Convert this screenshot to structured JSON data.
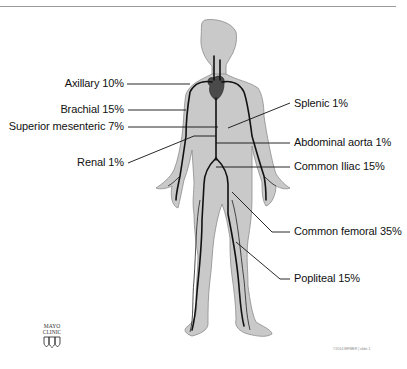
{
  "labels": [
    {
      "id": "axillary",
      "text": "Axillary 10%",
      "side": "left"
    },
    {
      "id": "brachial",
      "text": "Brachial 15%",
      "side": "left"
    },
    {
      "id": "superior-mesenteric",
      "text": "Superior mesenteric 7%",
      "side": "left"
    },
    {
      "id": "renal",
      "text": "Renal 1%",
      "side": "left"
    },
    {
      "id": "splenic",
      "text": "Splenic 1%",
      "side": "right"
    },
    {
      "id": "abdominal-aorta",
      "text": "Abdominal aorta  1%",
      "side": "right"
    },
    {
      "id": "common-iliac",
      "text": "Common Iliac 15%",
      "side": "right"
    },
    {
      "id": "common-femoral",
      "text": "Common femoral  35%",
      "side": "right"
    },
    {
      "id": "popliteal",
      "text": "Popliteal 15%",
      "side": "right"
    }
  ],
  "logo": {
    "line1": "MAYO",
    "line2": "CLINIC"
  },
  "footer": "©2014 MFMER  |  slide-1",
  "colors": {
    "body_fill": "#c8c8c8",
    "body_stroke": "#8a8a8a",
    "vessel": "#111111",
    "heart": "#555555"
  }
}
